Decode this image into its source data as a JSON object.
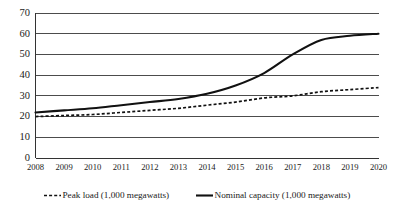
{
  "chart_data": {
    "type": "line",
    "title": "",
    "xlabel": "",
    "ylabel": "",
    "ylim": [
      0,
      70
    ],
    "ytick_step": 10,
    "grid": true,
    "legend_position": "bottom",
    "categories": [
      "2008",
      "2009",
      "2010",
      "2011",
      "2012",
      "2013",
      "2014",
      "2015",
      "2016",
      "2017",
      "2018",
      "2019",
      "2020"
    ],
    "ytick_labels": [
      "0",
      "10",
      "20",
      "30",
      "40",
      "50",
      "60",
      "70"
    ],
    "ytick_values": [
      0,
      10,
      20,
      30,
      40,
      50,
      60,
      70
    ],
    "series": [
      {
        "name": "Peak load (1,000 megawatts)",
        "style": "dashed",
        "color": "#111111",
        "values": [
          20,
          20.5,
          21,
          22,
          23,
          24,
          25.5,
          27,
          29,
          30,
          32,
          33,
          34
        ]
      },
      {
        "name": "Nominal capacity (1,000 megawatts)",
        "style": "solid",
        "color": "#111111",
        "values": [
          22,
          23,
          24,
          25.5,
          27,
          28.5,
          31,
          35,
          41,
          50,
          57,
          59,
          60
        ]
      }
    ]
  },
  "legend": {
    "items": [
      {
        "label": "Peak load (1,000 megawatts)",
        "style": "dashed"
      },
      {
        "label": "Nominal capacity (1,000 megawatts)",
        "style": "solid"
      }
    ]
  }
}
